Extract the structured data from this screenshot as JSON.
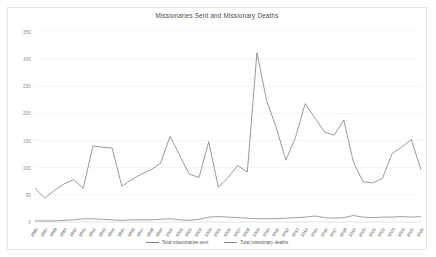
{
  "chart_data": {
    "type": "line",
    "title": "Missionaries Sent and Missionary Deaths",
    "xlabel": "",
    "ylabel": "",
    "ylim": [
      0,
      350
    ],
    "yticks": [
      0,
      50,
      100,
      150,
      200,
      250,
      300,
      350
    ],
    "ytick_labels": [
      "0",
      "50",
      "100",
      "150",
      "200",
      "250",
      "300",
      "350"
    ],
    "grid": true,
    "legend_position": "bottom",
    "categories": [
      "1886",
      "1887",
      "1888",
      "1889",
      "1890",
      "1891",
      "1892",
      "1893",
      "1894",
      "1895",
      "1896",
      "1897",
      "1898",
      "1899",
      "1900",
      "1901",
      "1902",
      "1903",
      "1904",
      "1905",
      "1906",
      "1907",
      "1908",
      "1909",
      "1910",
      "1911",
      "1912",
      "1913",
      "1914",
      "1915",
      "1916",
      "1917",
      "1918",
      "1919",
      "1920",
      "1921",
      "1922",
      "1923"
    ],
    "series": [
      {
        "name": "Total missionaries sent",
        "color": "#808080",
        "values": [
          62,
          44,
          58,
          70,
          78,
          62,
          140,
          138,
          136,
          66,
          78,
          88,
          96,
          108,
          158,
          122,
          88,
          82,
          148,
          64,
          82,
          104,
          92,
          312,
          224,
          174,
          114,
          156,
          218,
          192,
          166,
          160,
          188,
          110,
          74,
          72,
          80,
          126
        ]
      },
      {
        "name": "Total missionary deaths",
        "color": "#8a8a8a",
        "values": [
          2,
          2,
          2,
          3,
          4,
          6,
          6,
          5,
          4,
          3,
          4,
          4,
          4,
          5,
          6,
          4,
          3,
          5,
          9,
          10,
          9,
          8,
          7,
          6,
          6,
          6,
          7,
          8,
          9,
          11,
          8,
          7,
          8,
          12,
          9,
          8,
          9,
          9
        ]
      }
    ],
    "extra_points": {
      "sent_tail": [
        138,
        152,
        96
      ],
      "deaths_tail": [
        10,
        9,
        10
      ]
    }
  },
  "legend": {
    "items": [
      {
        "label": "Total missionaries sent"
      },
      {
        "label": "Total missionary deaths"
      }
    ]
  }
}
